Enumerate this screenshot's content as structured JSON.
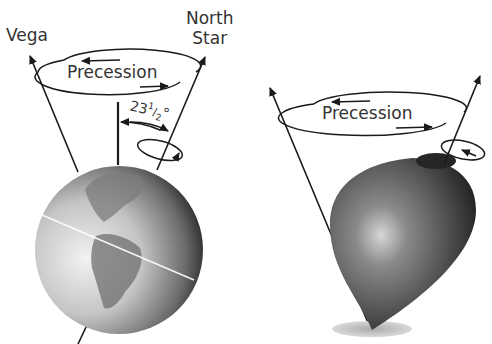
{
  "diagram": {
    "left": {
      "star_left_label": "Vega",
      "star_right_label_line1": "North",
      "star_right_label_line2": "Star",
      "precession_label": "Precession",
      "tilt_angle_label": "23",
      "tilt_angle_frac_num": "1",
      "tilt_angle_frac_den": "2",
      "tilt_angle_deg": "°"
    },
    "right": {
      "precession_label": "Precession"
    }
  },
  "colors": {
    "line": "#1a1a1a",
    "text": "#333333",
    "shadow": "#bdbdbd"
  }
}
